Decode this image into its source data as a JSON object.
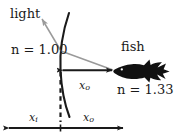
{
  "figure": {
    "background": "#ffffff",
    "ink_color": "#1a1a1a",
    "ray_color": "#9a9a9a",
    "width": 184,
    "height": 139
  },
  "labels": {
    "light": "light",
    "fish": "fish",
    "n_air": "n = 1.00",
    "n_water": "n = 1.33"
  },
  "measures": {
    "x_o_top": {
      "var": "x",
      "sub": "o"
    },
    "x_i_bottom": {
      "var": "x",
      "sub": "i"
    },
    "x_o_bottom": {
      "var": "x",
      "sub": "o"
    }
  },
  "elements": {
    "interface_curve": "water-surface-curve",
    "dashed_line": "image-position-dashed-line",
    "light_ray": "refracted-light-ray",
    "fish_silhouette": "fish-silhouette"
  }
}
